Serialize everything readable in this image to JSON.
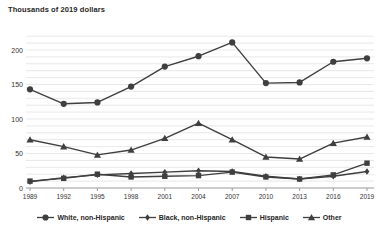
{
  "chart_data": {
    "type": "line",
    "title": "Thousands of 2019 dollars",
    "xlabel": "",
    "ylabel": "Thousands of 2019 dollars",
    "x": [
      1989,
      1992,
      1995,
      1998,
      2001,
      2004,
      2007,
      2010,
      2013,
      2016,
      2019
    ],
    "ylim": [
      0,
      220
    ],
    "yticks": [
      0,
      50,
      100,
      150,
      200
    ],
    "grid": "horizontal minor gridlines every 10 units",
    "legend_position": "bottom",
    "series": [
      {
        "name": "White, non-Hispanic",
        "marker": "circle",
        "values": [
          143,
          122,
          124,
          147,
          176,
          191,
          211,
          152,
          153,
          183,
          188
        ]
      },
      {
        "name": "Black, non-Hispanic",
        "marker": "diamond",
        "values": [
          9,
          15,
          19,
          21,
          23,
          25,
          24,
          17,
          13,
          17,
          24
        ]
      },
      {
        "name": "Hispanic",
        "marker": "square",
        "values": [
          10,
          14,
          20,
          16,
          17,
          18,
          23,
          16,
          13,
          19,
          36
        ]
      },
      {
        "name": "Other",
        "marker": "triangle",
        "values": [
          70,
          60,
          48,
          55,
          72,
          94,
          70,
          45,
          42,
          65,
          74
        ]
      }
    ],
    "colors": {
      "line": "#3f3f3f",
      "grid": "#dedede",
      "axis": "#9a9a9a",
      "text": "#333333",
      "background": "#ffffff"
    }
  }
}
